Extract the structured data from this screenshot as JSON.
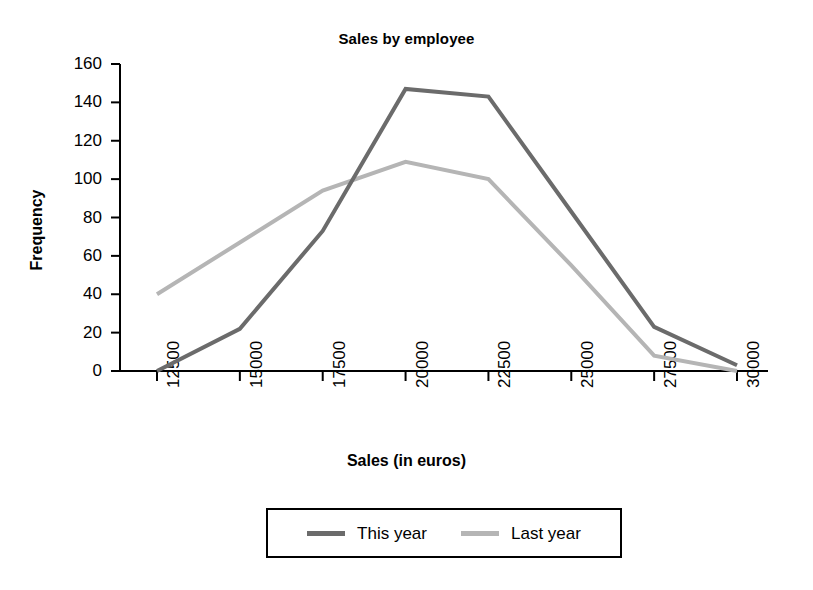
{
  "chart_data": {
    "type": "line",
    "title": "Sales by employee",
    "xlabel": "Sales (in euros)",
    "ylabel": "Frequency",
    "categories": [
      "12500",
      "15000",
      "17500",
      "20000",
      "22500",
      "25000",
      "27500",
      "30000"
    ],
    "series": [
      {
        "name": "This year",
        "color": "#6b6b6b",
        "values": [
          0,
          22,
          73,
          147,
          143,
          83,
          23,
          3
        ]
      },
      {
        "name": "Last year",
        "color": "#b5b5b5",
        "values": [
          40,
          67,
          94,
          109,
          100,
          55,
          8,
          0
        ]
      }
    ],
    "ylim": [
      0,
      160
    ],
    "yticks": [
      "0",
      "20",
      "40",
      "60",
      "80",
      "100",
      "120",
      "140",
      "160"
    ],
    "grid": false,
    "legend_position": "bottom",
    "axis_color": "#000000",
    "background": "#ffffff"
  },
  "legend": {
    "entries": [
      {
        "label": "This year",
        "color": "#6b6b6b"
      },
      {
        "label": "Last year",
        "color": "#b5b5b5"
      }
    ]
  }
}
